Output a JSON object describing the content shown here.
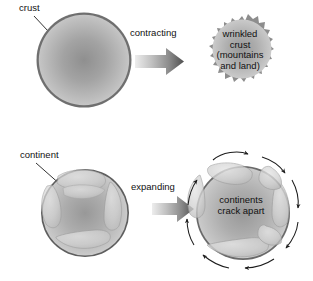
{
  "figure": {
    "background_color": "#ffffff",
    "rows": [
      {
        "id": "contracting-row",
        "process_label": "contracting",
        "before": {
          "id": "smooth-crust-sphere",
          "annotation": "crust",
          "description": "smooth shaded sphere with thin dark crust outline"
        },
        "after": {
          "id": "wrinkled-crust-sphere",
          "caption": "wrinkled\ncrust\n(mountains\nand land)",
          "caption_lines": [
            "wrinkled",
            "crust",
            "(mountains",
            "and land)"
          ],
          "description": "sphere surrounded by a thick jagged wrinkled crust ring"
        }
      },
      {
        "id": "expanding-row",
        "process_label": "expanding",
        "before": {
          "id": "continent-sphere",
          "annotation": "continent",
          "description": "sphere with pale continent plates covering the surface"
        },
        "after": {
          "id": "cracked-continents-sphere",
          "caption": "continents\ncrack apart",
          "caption_lines": [
            "continents",
            "crack apart"
          ],
          "description": "larger sphere with separated continent plates and curved outward arrows"
        }
      }
    ],
    "arrows": {
      "process_arrow_count": 2,
      "process_arrow_direction": "right",
      "spreading_arrow_count": 8,
      "spreading_arrow_style": "curved outward"
    },
    "colors": {
      "crust_outline": "#6b6b6b",
      "wrinkled_crust": "#8a8a8a",
      "sphere_dark": "#8f8f8f",
      "sphere_light": "#d2d2d2",
      "continent_fill": "#c9c9c9",
      "arrow_dark": "#5a5a5a",
      "arrow_light": "#e2e2e2",
      "text": "#111111",
      "background": "#ffffff"
    }
  }
}
